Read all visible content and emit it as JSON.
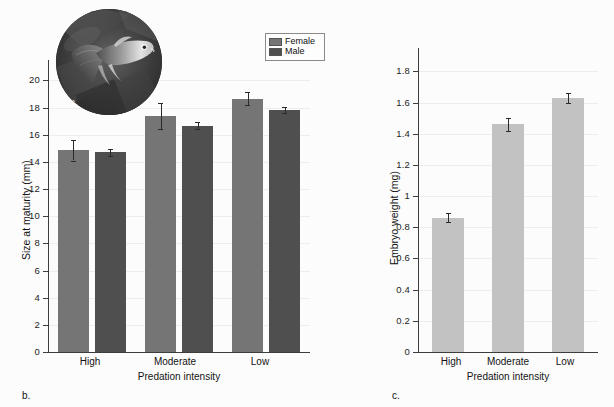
{
  "figure": {
    "background_color": "#fcfcfc",
    "panels": [
      {
        "letter": "a.",
        "name": "guppy-photo-inset"
      },
      {
        "letter": "b.",
        "name": "size-at-maturity-chart"
      },
      {
        "letter": "c.",
        "name": "embryo-weight-chart"
      }
    ]
  },
  "photo_inset": {
    "letter": "a.",
    "alt": "guppy-photograph",
    "description": "Circular black and white photograph of a guppy fish"
  },
  "legend": {
    "items": [
      {
        "label": "Female",
        "color": "#757575"
      },
      {
        "label": "Male",
        "color": "#4f4f4f"
      }
    ]
  },
  "chart_data": [
    {
      "type": "bar",
      "name": "size-at-maturity",
      "panel_letter": "b.",
      "title": "",
      "xlabel": "Predation intensity",
      "ylabel": "Size at maturity (mm)",
      "categories": [
        "High",
        "Moderate",
        "Low"
      ],
      "ylim": [
        0,
        21.5
      ],
      "yticks": [
        0,
        2,
        4,
        6,
        8,
        10,
        12,
        14,
        16,
        18,
        20
      ],
      "ytick_labels": [
        "0",
        "2",
        "4",
        "6",
        "8",
        "10",
        "12",
        "14",
        "16",
        "18",
        "20"
      ],
      "grid": true,
      "legend_position": "top-right",
      "series": [
        {
          "name": "Female",
          "color": "#757575",
          "values": [
            14.85,
            17.4,
            18.65
          ],
          "errors": [
            0.75,
            0.95,
            0.5
          ]
        },
        {
          "name": "Male",
          "color": "#4f4f4f",
          "values": [
            14.7,
            16.65,
            17.85
          ],
          "errors": [
            0.25,
            0.25,
            0.22
          ]
        }
      ]
    },
    {
      "type": "bar",
      "name": "embryo-weight",
      "panel_letter": "c.",
      "title": "",
      "xlabel": "Predation intensity",
      "ylabel": "Embryo weight (mg)",
      "categories": [
        "High",
        "Moderate",
        "Low"
      ],
      "ylim": [
        0,
        1.95
      ],
      "yticks": [
        0,
        0.2,
        0.4,
        0.6,
        0.8,
        1,
        1.2,
        1.4,
        1.6,
        1.8
      ],
      "ytick_labels": [
        "0",
        "0.2",
        "0.4",
        "0.6",
        "0.8",
        "1",
        "1.2",
        "1.4",
        "1.6",
        "1.8"
      ],
      "grid": true,
      "series": [
        {
          "name": "Embryo weight",
          "color": "#c2c2c2",
          "values": [
            0.862,
            1.462,
            1.63
          ],
          "errors": [
            0.028,
            0.042,
            0.032
          ]
        }
      ]
    }
  ]
}
